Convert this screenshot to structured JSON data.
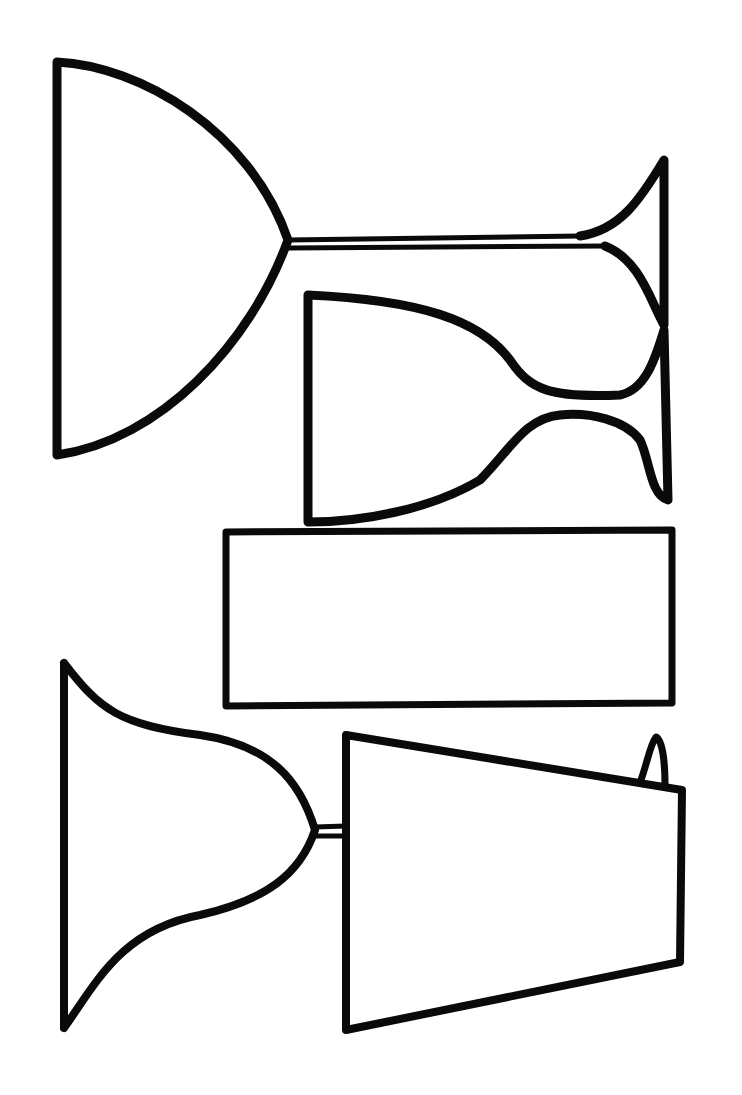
{
  "canvas": {
    "width": 742,
    "height": 1095,
    "background": "#ffffff",
    "ink": "#0a0a0a"
  },
  "drawing": {
    "description": "Hand-drawn outlines of glassware silhouettes, rotated sideways",
    "shapes": [
      {
        "name": "goblet-bowl",
        "stroke_width": 9,
        "d": "M57 62 L57 455 M57 62 C140 66 250 130 288 240 C250 345 160 440 57 455"
      },
      {
        "name": "goblet-stem",
        "stroke_width": 5,
        "d": "M288 240 L580 236 M288 248 L605 246"
      },
      {
        "name": "goblet-foot",
        "stroke_width": 9,
        "d": "M580 236 C620 230 640 200 664 160 L664 325 C650 300 640 260 605 246"
      },
      {
        "name": "wine-glass",
        "stroke_width": 9,
        "d": "M308 295 L308 522 M308 295 C420 300 480 320 510 360 C530 390 550 398 620 395 C645 390 655 360 664 330 L668 500 C650 495 650 460 640 440 C625 420 590 412 560 415 C525 418 510 450 480 480 C430 510 360 522 308 522"
      },
      {
        "name": "rectangle-tumbler",
        "stroke_width": 7,
        "d": "M226 532 L672 530 L672 703 L226 706 Z"
      },
      {
        "name": "flared-bowl",
        "stroke_width": 8,
        "d": "M64 663 L64 1028 M64 663 C100 710 120 725 200 735 C270 745 300 780 315 830 C300 875 265 900 200 915 C120 930 95 985 64 1028"
      },
      {
        "name": "flared-bowl-stem",
        "stroke_width": 5,
        "d": "M315 827 L346 826 M315 836 L346 836"
      },
      {
        "name": "tapered-tumbler",
        "stroke_width": 8,
        "d": "M346 735 L346 1030 L680 962 L682 790 Z"
      },
      {
        "name": "tumbler-handle",
        "stroke_width": 7,
        "d": "M641 780 C648 760 650 745 656 737 C662 740 665 760 665 785"
      }
    ]
  }
}
